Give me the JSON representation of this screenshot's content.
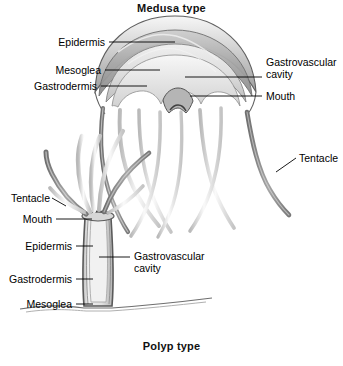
{
  "figure": {
    "name": "cnidarian-body-forms",
    "titles": {
      "medusa": "Medusa type",
      "polyp": "Polyp type"
    },
    "medusa_labels": {
      "epidermis": "Epidermis",
      "mesoglea": "Mesoglea",
      "gastrodermis": "Gastrodermis",
      "gastrovascular_cavity": "Gastrovascular cavity",
      "mouth": "Mouth",
      "tentacle": "Tentacle"
    },
    "polyp_labels": {
      "tentacle": "Tentacle",
      "mouth": "Mouth",
      "epidermis": "Epidermis",
      "gastrodermis": "Gastrodermis",
      "mesoglea": "Mesoglea",
      "gastrovascular_cavity": "Gastrovascular cavity"
    },
    "colors": {
      "ink": "#000000",
      "background": "#ffffff",
      "outline_dark": "#5a5a5a",
      "outline_mid": "#8a8a8a",
      "fill_light": "#f2f2f2",
      "fill_mid": "#c9c9c9",
      "fill_dark": "#9a9a9a",
      "substrate": "#7b7b7b"
    }
  }
}
